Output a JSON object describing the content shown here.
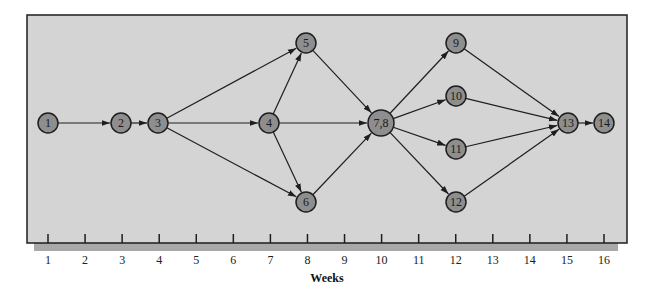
{
  "diagram": {
    "type": "network-schedule",
    "colors": {
      "panel": "#d4d4d4",
      "shadow": "#a9a9a9",
      "frame": "#1e1e1e",
      "node_fill": "#8e8e8e",
      "node_stroke": "#1e1e1e",
      "edge": "#1e1e1e"
    },
    "axis": {
      "title": "Weeks",
      "ticks": [
        "1",
        "2",
        "3",
        "4",
        "5",
        "6",
        "7",
        "8",
        "9",
        "10",
        "11",
        "12",
        "13",
        "14",
        "15",
        "16"
      ]
    },
    "nodes": [
      {
        "id": "1",
        "label": "1",
        "week": 1,
        "x": 48,
        "y": 123,
        "r": 10
      },
      {
        "id": "2",
        "label": "2",
        "week": 3,
        "x": 121,
        "y": 123,
        "r": 10
      },
      {
        "id": "3",
        "label": "3",
        "week": 4,
        "x": 158,
        "y": 123,
        "r": 10
      },
      {
        "id": "4",
        "label": "4",
        "week": 7,
        "x": 269,
        "y": 123,
        "r": 10
      },
      {
        "id": "5",
        "label": "5",
        "week": 8,
        "x": 306,
        "y": 43,
        "r": 10
      },
      {
        "id": "6",
        "label": "6",
        "week": 8,
        "x": 306,
        "y": 202,
        "r": 10
      },
      {
        "id": "78",
        "label": "7,8",
        "week": 10,
        "x": 381,
        "y": 123,
        "r": 13
      },
      {
        "id": "9",
        "label": "9",
        "week": 12,
        "x": 456,
        "y": 43,
        "r": 10
      },
      {
        "id": "10",
        "label": "10",
        "week": 12,
        "x": 456,
        "y": 96,
        "r": 10
      },
      {
        "id": "11",
        "label": "11",
        "week": 12,
        "x": 456,
        "y": 149,
        "r": 10
      },
      {
        "id": "12",
        "label": "12",
        "week": 12,
        "x": 456,
        "y": 202,
        "r": 10
      },
      {
        "id": "13",
        "label": "13",
        "week": 15,
        "x": 568,
        "y": 123,
        "r": 10
      },
      {
        "id": "14",
        "label": "14",
        "week": 16,
        "x": 604,
        "y": 123,
        "r": 10
      }
    ],
    "edges": [
      [
        "1",
        "2"
      ],
      [
        "2",
        "3"
      ],
      [
        "3",
        "5"
      ],
      [
        "3",
        "4"
      ],
      [
        "3",
        "6"
      ],
      [
        "4",
        "5"
      ],
      [
        "4",
        "78"
      ],
      [
        "4",
        "6"
      ],
      [
        "5",
        "78"
      ],
      [
        "6",
        "78"
      ],
      [
        "78",
        "9"
      ],
      [
        "78",
        "10"
      ],
      [
        "78",
        "11"
      ],
      [
        "78",
        "12"
      ],
      [
        "9",
        "13"
      ],
      [
        "10",
        "13"
      ],
      [
        "11",
        "13"
      ],
      [
        "12",
        "13"
      ],
      [
        "13",
        "14"
      ]
    ]
  }
}
